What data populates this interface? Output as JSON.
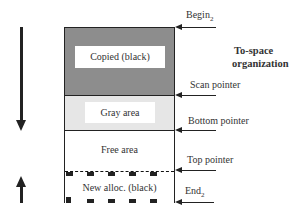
{
  "title": {
    "line1": "To-space",
    "line2": "organization"
  },
  "regions": [
    {
      "name": "copied",
      "label": "Copied (black)",
      "fill": "dense gray hatch"
    },
    {
      "name": "gray",
      "label": "Gray area",
      "fill": "light gray dots"
    },
    {
      "name": "free",
      "label": "Free area",
      "fill": "white"
    },
    {
      "name": "new_alloc",
      "label": "New alloc. (black)",
      "fill": "white with black blocks"
    }
  ],
  "pointers": [
    {
      "label": "Begin",
      "sub": "2",
      "target": "top of to-space"
    },
    {
      "label": "Scan pointer",
      "sub": "",
      "target": "copied/gray boundary"
    },
    {
      "label": "Bottom pointer",
      "sub": "",
      "target": "gray/free boundary"
    },
    {
      "label": "Top pointer",
      "sub": "",
      "target": "free/new alloc boundary"
    },
    {
      "label": "End",
      "sub": "2",
      "target": "bottom of to-space"
    }
  ],
  "side_arrows": [
    {
      "direction": "down",
      "meaning": "scan/bottom grow downward"
    },
    {
      "direction": "up",
      "meaning": "top grows upward"
    }
  ],
  "colors": {
    "line": "#222222",
    "copied_fill": "#bdbdbd",
    "gray_fill": "#e6e6e6"
  }
}
